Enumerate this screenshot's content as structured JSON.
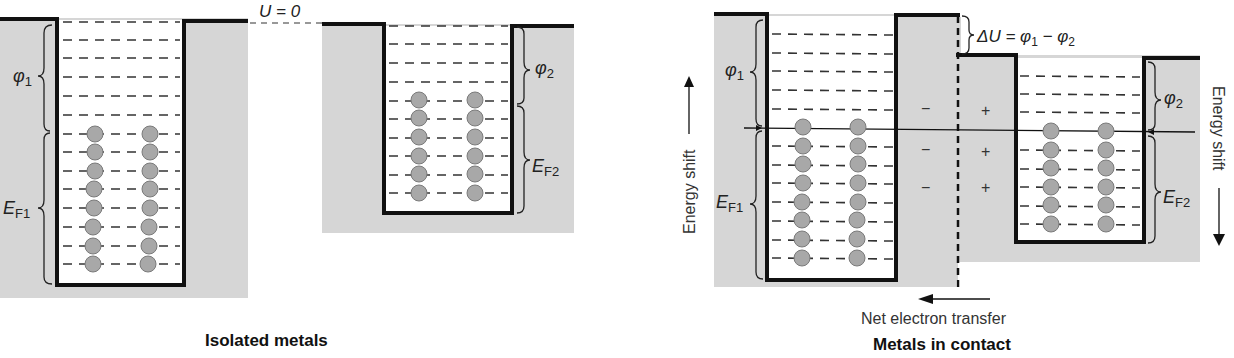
{
  "colors": {
    "metal_fill": "#d6d6d6",
    "well_fill": "#ffffff",
    "wall_stroke": "#111111",
    "electron_fill": "#a8a8a8",
    "electron_stroke": "#7a7a7a",
    "level_dash": "#333333"
  },
  "isolated": {
    "caption": "Isolated metals",
    "vacuum_label": "U = 0",
    "metal1": {
      "work_function_label": "φ",
      "work_function_sub": "1",
      "fermi_label": "E",
      "fermi_sub": "F1",
      "empty_levels": 6,
      "filled_levels": 8
    },
    "metal2": {
      "work_function_label": "φ",
      "work_function_sub": "2",
      "fermi_label": "E",
      "fermi_sub": "F2",
      "empty_levels": 4,
      "filled_levels": 6
    }
  },
  "contact": {
    "caption": "Metals in contact",
    "delta_u_label": "ΔU = φ",
    "delta_u_sub1": "1",
    "delta_u_minus": " − φ",
    "delta_u_sub2": "2",
    "transfer_label": "Net electron transfer",
    "energy_shift_left": "Energy shift",
    "energy_shift_right": "Energy shift",
    "minus_sign": "−",
    "plus_sign": "+",
    "metal1": {
      "work_function_label": "φ",
      "work_function_sub": "1",
      "fermi_label": "E",
      "fermi_sub": "F1",
      "empty_levels": 5,
      "filled_levels": 8
    },
    "metal2": {
      "work_function_label": "φ",
      "work_function_sub": "2",
      "fermi_label": "E",
      "fermi_sub": "F2",
      "empty_levels": 3,
      "filled_levels": 6
    }
  }
}
